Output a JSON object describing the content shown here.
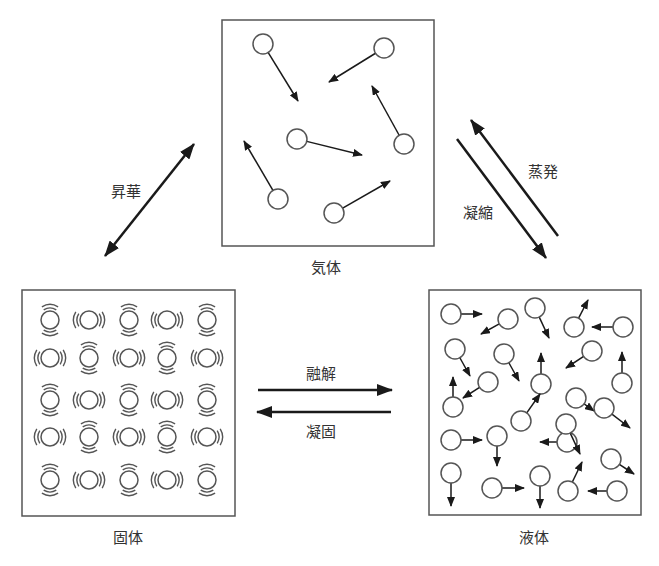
{
  "states": {
    "gas": {
      "label": "気体"
    },
    "solid": {
      "label": "固体"
    },
    "liquid": {
      "label": "液体"
    }
  },
  "transitions": {
    "sublimation": {
      "label": "昇華",
      "between": [
        "固体",
        "気体"
      ],
      "bidirectional": true
    },
    "evaporation": {
      "label": "蒸発",
      "from": "液体",
      "to": "気体"
    },
    "condensation": {
      "label": "凝縮",
      "from": "気体",
      "to": "液体"
    },
    "melting": {
      "label": "融解",
      "from": "固体",
      "to": "液体"
    },
    "freezing": {
      "label": "凝固",
      "from": "液体",
      "to": "固体"
    }
  },
  "colors": {
    "stroke": "#555555",
    "arrow": "#1a1a1a",
    "text": "#333333",
    "background": "#ffffff"
  },
  "gas_molecules": [
    {
      "cx": 263,
      "cy": 44,
      "tx": 298,
      "ty": 101
    },
    {
      "cx": 384,
      "cy": 48,
      "tx": 329,
      "ty": 82
    },
    {
      "cx": 297,
      "cy": 139,
      "tx": 362,
      "ty": 155
    },
    {
      "cx": 404,
      "cy": 144,
      "tx": 372,
      "ty": 86
    },
    {
      "cx": 278,
      "cy": 199,
      "tx": 244,
      "ty": 141
    },
    {
      "cx": 334,
      "cy": 213,
      "tx": 390,
      "ty": 181
    }
  ],
  "solid_lattice": {
    "cols": [
      50,
      89,
      129,
      167,
      207
    ],
    "rows": [
      320,
      358,
      400,
      437,
      480
    ],
    "pattern": [
      [
        "V",
        "H",
        "V",
        "H",
        "V"
      ],
      [
        "H",
        "V",
        "H",
        "V",
        "H"
      ],
      [
        "V",
        "H",
        "V",
        "H",
        "V"
      ],
      [
        "H",
        "V",
        "H",
        "V",
        "H"
      ],
      [
        "V",
        "H",
        "V",
        "H",
        "V"
      ]
    ]
  },
  "liquid_molecules": [
    {
      "cx": 451,
      "cy": 314,
      "tx": 482,
      "ty": 314
    },
    {
      "cx": 508,
      "cy": 319,
      "tx": 481,
      "ty": 334
    },
    {
      "cx": 535,
      "cy": 308,
      "tx": 549,
      "ty": 338
    },
    {
      "cx": 574,
      "cy": 327,
      "tx": 588,
      "ty": 300
    },
    {
      "cx": 623,
      "cy": 327,
      "tx": 592,
      "ty": 327
    },
    {
      "cx": 455,
      "cy": 349,
      "tx": 470,
      "ty": 376
    },
    {
      "cx": 504,
      "cy": 354,
      "tx": 519,
      "ty": 381
    },
    {
      "cx": 541,
      "cy": 384,
      "tx": 541,
      "ty": 353
    },
    {
      "cx": 592,
      "cy": 351,
      "tx": 566,
      "ty": 368
    },
    {
      "cx": 622,
      "cy": 383,
      "tx": 622,
      "ty": 352
    },
    {
      "cx": 488,
      "cy": 382,
      "tx": 463,
      "ty": 398
    },
    {
      "cx": 453,
      "cy": 407,
      "tx": 453,
      "ty": 377
    },
    {
      "cx": 576,
      "cy": 398,
      "tx": 594,
      "ty": 411
    },
    {
      "cx": 604,
      "cy": 408,
      "tx": 630,
      "ty": 428
    },
    {
      "cx": 521,
      "cy": 421,
      "tx": 540,
      "ty": 394
    },
    {
      "cx": 451,
      "cy": 440,
      "tx": 482,
      "ty": 440
    },
    {
      "cx": 497,
      "cy": 436,
      "tx": 497,
      "ty": 466
    },
    {
      "cx": 567,
      "cy": 442,
      "tx": 540,
      "ty": 442
    },
    {
      "cx": 566,
      "cy": 424,
      "tx": 580,
      "ty": 454
    },
    {
      "cx": 611,
      "cy": 459,
      "tx": 634,
      "ty": 474
    },
    {
      "cx": 451,
      "cy": 473,
      "tx": 451,
      "ty": 506
    },
    {
      "cx": 492,
      "cy": 488,
      "tx": 524,
      "ty": 488
    },
    {
      "cx": 540,
      "cy": 476,
      "tx": 540,
      "ty": 508
    },
    {
      "cx": 568,
      "cy": 491,
      "tx": 582,
      "ty": 462
    },
    {
      "cx": 617,
      "cy": 491,
      "tx": 588,
      "ty": 491
    }
  ]
}
